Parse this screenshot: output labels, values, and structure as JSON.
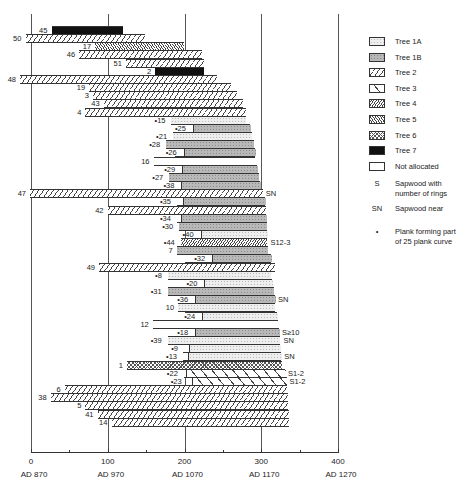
{
  "chart_data": {
    "type": "bar",
    "subtype": "floating-horizontal-bar (dendrochronology timber ring sequences)",
    "title": "",
    "xlabel": "",
    "ylabel": "",
    "x_axis": {
      "range": [
        0,
        400
      ],
      "ticks": [
        {
          "value": 0,
          "label": "0",
          "date": "AD 870"
        },
        {
          "value": 100,
          "label": "100",
          "date": "AD 970"
        },
        {
          "value": 200,
          "label": "200",
          "date": "AD 1070"
        },
        {
          "value": 300,
          "label": "300",
          "date": "AD 1170"
        },
        {
          "value": 400,
          "label": "400",
          "date": "AD 1270"
        }
      ],
      "minor_ticks": [
        50,
        150,
        250,
        350
      ]
    },
    "grid": "vertical lines at 0, 100, 200, 300, 400",
    "legend_position": "right",
    "legend": [
      {
        "key": "1A",
        "label": "Tree  1A"
      },
      {
        "key": "1B",
        "label": "Tree  1B"
      },
      {
        "key": "2",
        "label": "Tree  2"
      },
      {
        "key": "3",
        "label": "Tree  3"
      },
      {
        "key": "4",
        "label": "Tree  4"
      },
      {
        "key": "5",
        "label": "Tree  5"
      },
      {
        "key": "6",
        "label": "Tree  6"
      },
      {
        "key": "7",
        "label": "Tree  7"
      },
      {
        "key": "NA",
        "label": "Not allocated"
      }
    ],
    "legend_symbols": [
      {
        "symbol": "S",
        "label": "Sapwood with\nnumber of rings"
      },
      {
        "symbol": "SN",
        "label": "Sapwood near"
      },
      {
        "symbol": "•",
        "label": "Plank forming part\nof 25 plank curve"
      }
    ],
    "series": [
      {
        "id": "45",
        "plank25": false,
        "segments": [
          {
            "tree": "7",
            "start": 27,
            "end": 120
          }
        ],
        "note": ""
      },
      {
        "id": "50",
        "plank25": false,
        "segments": [
          {
            "tree": "2",
            "start": -7,
            "end": 149
          }
        ],
        "note": ""
      },
      {
        "id": "17",
        "plank25": false,
        "segments": [
          {
            "tree": "5",
            "start": 84,
            "end": 200
          }
        ],
        "note": ""
      },
      {
        "id": "46",
        "plank25": false,
        "segments": [
          {
            "tree": "2",
            "start": 63,
            "end": 223
          }
        ],
        "note": ""
      },
      {
        "id": "51",
        "plank25": false,
        "segments": [
          {
            "tree": "2",
            "start": 124,
            "end": 225
          }
        ],
        "note": ""
      },
      {
        "id": "2",
        "plank25": false,
        "segments": [
          {
            "tree": "7",
            "start": 162,
            "end": 225
          }
        ],
        "note": ""
      },
      {
        "id": "48",
        "plank25": false,
        "segments": [
          {
            "tree": "2",
            "start": -14,
            "end": 243
          }
        ],
        "note": ""
      },
      {
        "id": "19",
        "plank25": false,
        "segments": [
          {
            "tree": "2",
            "start": 76,
            "end": 261
          }
        ],
        "note": ""
      },
      {
        "id": "3",
        "plank25": false,
        "segments": [
          {
            "tree": "2",
            "start": 81,
            "end": 268
          }
        ],
        "note": ""
      },
      {
        "id": "43",
        "plank25": false,
        "segments": [
          {
            "tree": "2",
            "start": 95,
            "end": 276
          }
        ],
        "note": ""
      },
      {
        "id": "4",
        "plank25": false,
        "segments": [
          {
            "tree": "2",
            "start": 71,
            "end": 280
          }
        ],
        "note": ""
      },
      {
        "id": "15",
        "plank25": true,
        "segments": [
          {
            "tree": "1A",
            "start": 183,
            "end": 280
          }
        ],
        "note": ""
      },
      {
        "id": "25",
        "plank25": true,
        "segments": [
          {
            "tree": "NA",
            "start": 196,
            "end": 211
          },
          {
            "tree": "1B",
            "start": 211,
            "end": 286
          }
        ],
        "note": ""
      },
      {
        "id": "21",
        "plank25": true,
        "segments": [
          {
            "tree": "1A",
            "start": 185,
            "end": 288
          }
        ],
        "note": ""
      },
      {
        "id": "28",
        "plank25": true,
        "segments": [
          {
            "tree": "1B",
            "start": 176,
            "end": 290
          }
        ],
        "note": ""
      },
      {
        "id": "26",
        "plank25": true,
        "segments": [
          {
            "tree": "NA",
            "start": 188,
            "end": 199
          },
          {
            "tree": "1B",
            "start": 199,
            "end": 292
          }
        ],
        "note": ""
      },
      {
        "id": "16",
        "plank25": false,
        "segments": [
          {
            "tree": "NA",
            "start": 160,
            "end": 292
          }
        ],
        "note": ""
      },
      {
        "id": "29",
        "plank25": true,
        "segments": [
          {
            "tree": "NA",
            "start": 183,
            "end": 197
          },
          {
            "tree": "1B",
            "start": 197,
            "end": 294
          }
        ],
        "note": ""
      },
      {
        "id": "27",
        "plank25": true,
        "segments": [
          {
            "tree": "1B",
            "start": 180,
            "end": 297
          }
        ],
        "note": ""
      },
      {
        "id": "38",
        "plank25": true,
        "segments": [
          {
            "tree": "NA",
            "start": 183,
            "end": 196
          },
          {
            "tree": "1B",
            "start": 196,
            "end": 299
          }
        ],
        "note": ""
      },
      {
        "id": "47",
        "plank25": false,
        "segments": [
          {
            "tree": "2",
            "start": -1,
            "end": 302
          }
        ],
        "note": "SN"
      },
      {
        "id": "35",
        "plank25": true,
        "segments": [
          {
            "tree": "NA",
            "start": 190,
            "end": 198
          },
          {
            "tree": "1B",
            "start": 198,
            "end": 305
          }
        ],
        "note": ""
      },
      {
        "id": "42",
        "plank25": false,
        "segments": [
          {
            "tree": "2",
            "start": 100,
            "end": 306
          }
        ],
        "note": ""
      },
      {
        "id": "34",
        "plank25": true,
        "segments": [
          {
            "tree": "NA",
            "start": 190,
            "end": 195
          },
          {
            "tree": "1B",
            "start": 195,
            "end": 306
          }
        ],
        "note": ""
      },
      {
        "id": "30",
        "plank25": true,
        "segments": [
          {
            "tree": "1B",
            "start": 193,
            "end": 307
          }
        ],
        "note": ""
      },
      {
        "id": "40",
        "plank25": true,
        "segments": [
          {
            "tree": "NA",
            "start": 211,
            "end": 221
          },
          {
            "tree": "1A",
            "start": 221,
            "end": 307
          }
        ],
        "note": ""
      },
      {
        "id": "44",
        "plank25": true,
        "segments": [
          {
            "tree": "4",
            "start": 195,
            "end": 308
          }
        ],
        "note": "S12-3"
      },
      {
        "id": "7",
        "plank25": false,
        "segments": [
          {
            "tree": "1B",
            "start": 190,
            "end": 309
          }
        ],
        "note": ""
      },
      {
        "id": "32",
        "plank25": true,
        "segments": [
          {
            "tree": "NA",
            "start": 200,
            "end": 236
          },
          {
            "tree": "1B",
            "start": 236,
            "end": 313
          }
        ],
        "note": ""
      },
      {
        "id": "49",
        "plank25": false,
        "segments": [
          {
            "tree": "2",
            "start": 89,
            "end": 318
          }
        ],
        "note": ""
      },
      {
        "id": "8",
        "plank25": true,
        "segments": [
          {
            "tree": "1A",
            "start": 178,
            "end": 313
          }
        ],
        "note": ""
      },
      {
        "id": "20",
        "plank25": true,
        "segments": [
          {
            "tree": "NA",
            "start": 196,
            "end": 226
          },
          {
            "tree": "1A",
            "start": 226,
            "end": 314
          }
        ],
        "note": ""
      },
      {
        "id": "31",
        "plank25": true,
        "segments": [
          {
            "tree": "1B",
            "start": 178,
            "end": 316
          }
        ],
        "note": ""
      },
      {
        "id": "36",
        "plank25": true,
        "segments": [
          {
            "tree": "NA",
            "start": 200,
            "end": 214
          },
          {
            "tree": "1B",
            "start": 214,
            "end": 318
          }
        ],
        "note": "SN"
      },
      {
        "id": "10",
        "plank25": false,
        "segments": [
          {
            "tree": "1A",
            "start": 192,
            "end": 318
          }
        ],
        "note": ""
      },
      {
        "id": "24",
        "plank25": true,
        "segments": [
          {
            "tree": "NA",
            "start": 200,
            "end": 223
          },
          {
            "tree": "1A",
            "start": 223,
            "end": 320
          }
        ],
        "note": ""
      },
      {
        "id": "12",
        "plank25": false,
        "segments": [
          {
            "tree": "NA",
            "start": 159,
            "end": 322
          }
        ],
        "note": ""
      },
      {
        "id": "18",
        "plank25": true,
        "segments": [
          {
            "tree": "NA",
            "start": 200,
            "end": 214
          },
          {
            "tree": "1B",
            "start": 214,
            "end": 323
          }
        ],
        "note": "S≥10"
      },
      {
        "id": "39",
        "plank25": true,
        "segments": [
          {
            "tree": "1A",
            "start": 178,
            "end": 325
          }
        ],
        "note": "SN"
      },
      {
        "id": "9",
        "plank25": true,
        "segments": [
          {
            "tree": "NA",
            "start": 199,
            "end": 206
          },
          {
            "tree": "1A",
            "start": 206,
            "end": 325
          }
        ],
        "note": ""
      },
      {
        "id": "13",
        "plank25": true,
        "segments": [
          {
            "tree": "NA",
            "start": 198,
            "end": 204
          },
          {
            "tree": "1A",
            "start": 204,
            "end": 326
          }
        ],
        "note": "SN"
      },
      {
        "id": "1",
        "plank25": false,
        "segments": [
          {
            "tree": "6",
            "start": 125,
            "end": 327
          }
        ],
        "note": ""
      },
      {
        "id": "22",
        "plank25": true,
        "segments": [
          {
            "tree": "NA",
            "start": 199,
            "end": 202
          },
          {
            "tree": "3",
            "start": 202,
            "end": 331
          }
        ],
        "note": "S1-2"
      },
      {
        "id": "23",
        "plank25": true,
        "segments": [
          {
            "tree": "NA",
            "start": 204,
            "end": 210
          },
          {
            "tree": "3",
            "start": 210,
            "end": 333
          }
        ],
        "note": "S1-2"
      },
      {
        "id": "6",
        "plank25": false,
        "segments": [
          {
            "tree": "2",
            "start": 44,
            "end": 334
          }
        ],
        "note": ""
      },
      {
        "id": "38",
        "plank25": false,
        "segments": [
          {
            "tree": "2",
            "start": 26,
            "end": 335
          }
        ],
        "note": ""
      },
      {
        "id": "5",
        "plank25": false,
        "segments": [
          {
            "tree": "2",
            "start": 71,
            "end": 335
          }
        ],
        "note": ""
      },
      {
        "id": "41",
        "plank25": false,
        "segments": [
          {
            "tree": "2",
            "start": 87,
            "end": 336
          }
        ],
        "note": ""
      },
      {
        "id": "14",
        "plank25": false,
        "segments": [
          {
            "tree": "2",
            "start": 105,
            "end": 336
          }
        ],
        "note": ""
      }
    ]
  }
}
